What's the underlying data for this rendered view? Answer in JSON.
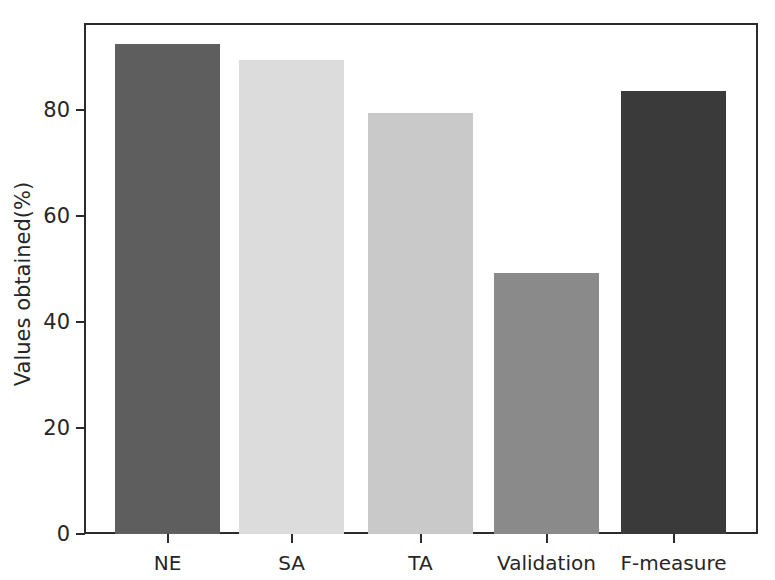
{
  "chart_data": {
    "type": "bar",
    "title": "",
    "subtitle": "",
    "xlabel": "",
    "ylabel": "Values obtained(%)",
    "categories": [
      "NE",
      "SA",
      "TA",
      "Validation",
      "F-measure"
    ],
    "values": [
      92.5,
      89.4,
      79.4,
      49.2,
      83.6
    ],
    "series": [
      {
        "name": "Values obtained(%)",
        "values": [
          92.5,
          89.4,
          79.4,
          49.2,
          83.6
        ]
      }
    ],
    "bar_colors": [
      "#5e5e5e",
      "#dcdcdc",
      "#c9c9c9",
      "#8a8a8a",
      "#3a3a3a"
    ],
    "ylim": [
      0,
      95
    ],
    "yticks": [
      0,
      20,
      40,
      60,
      80
    ],
    "ytick_labels": [
      "0",
      "20",
      "40",
      "60",
      "80"
    ],
    "grid": false,
    "legend": false,
    "legend_position": "none",
    "axis_color": "#2b2b2b",
    "background_color": "#ffffff"
  },
  "axes": {
    "y_title": "Values obtained(%)",
    "y_ticks": [
      {
        "label": "80",
        "value": 80
      },
      {
        "label": "60",
        "value": 60
      },
      {
        "label": "40",
        "value": 40
      },
      {
        "label": "20",
        "value": 20
      },
      {
        "label": "0",
        "value": 0
      }
    ],
    "x_ticks": [
      {
        "label": "NE"
      },
      {
        "label": "SA"
      },
      {
        "label": "TA"
      },
      {
        "label": "Validation"
      },
      {
        "label": "F-measure"
      }
    ]
  }
}
